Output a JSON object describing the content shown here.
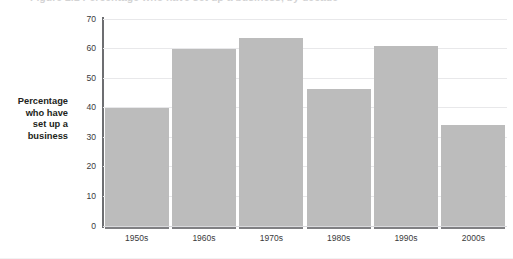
{
  "figure": {
    "cutoff_title": "Figure 2.1  Percentage who have set up a business, by decade",
    "y_caption_lines": [
      "Percentage",
      "who have",
      "set up a",
      "business"
    ],
    "bar_color": "#bcbcbc",
    "gridline_color": "#e8e8ea",
    "axis_color": "#6d6e71",
    "text_color": "#231f20"
  },
  "chart_data": {
    "type": "bar",
    "title": "",
    "xlabel": "",
    "ylabel": "Percentage who have set up a business",
    "categories": [
      "1950s",
      "1960s",
      "1970s",
      "1980s",
      "1990s",
      "2000s"
    ],
    "values": [
      40,
      60,
      63.5,
      46.5,
      61,
      34
    ],
    "series": [
      {
        "name": "Percentage who have set up a business",
        "values": [
          40,
          60,
          63.5,
          46.5,
          61,
          34
        ]
      }
    ],
    "ylim": [
      0,
      70
    ],
    "ytick_labels": [
      "0",
      "10",
      "20",
      "30",
      "40",
      "50",
      "60",
      "70"
    ],
    "ytick_values": [
      0,
      10,
      20,
      30,
      40,
      50,
      60,
      70
    ],
    "grid": true,
    "grid_axis": "y",
    "legend": false,
    "legend_position": "none"
  }
}
